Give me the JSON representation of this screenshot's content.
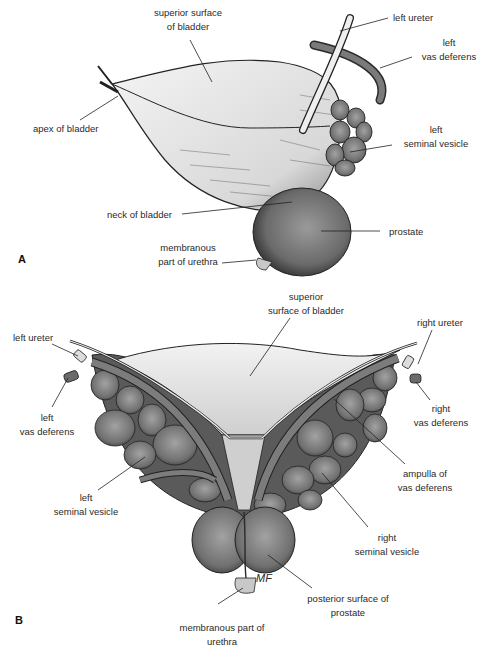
{
  "figure_a": {
    "panel_label": "A",
    "labels": {
      "superior_surface_1": "superior surface",
      "superior_surface_2": "of bladder",
      "left_ureter": "left ureter",
      "left_vas_1": "left",
      "left_vas_2": "vas deferens",
      "apex": "apex of bladder",
      "left_sv_1": "left",
      "left_sv_2": "seminal vesicle",
      "neck": "neck of bladder",
      "prostate": "prostate",
      "membranous_1": "membranous",
      "membranous_2": "part of urethra"
    }
  },
  "figure_b": {
    "panel_label": "B",
    "labels": {
      "superior_1": "superior",
      "superior_2": "surface of bladder",
      "left_ureter": "left ureter",
      "right_ureter": "right ureter",
      "left_vas_1": "left",
      "left_vas_2": "vas deferens",
      "right_vas_1": "right",
      "right_vas_2": "vas deferens",
      "ampulla_1": "ampulla of",
      "ampulla_2": "vas deferens",
      "left_sv_1": "left",
      "left_sv_2": "seminal vesicle",
      "right_sv_1": "right",
      "right_sv_2": "seminal vesicle",
      "posterior_1": "posterior surface of",
      "posterior_2": "prostate",
      "membranous_1": "membranous part of",
      "membranous_2": "urethra",
      "signature": "MF"
    }
  },
  "colors": {
    "organ_dark": "#5e5e5e",
    "organ_mid": "#8a8a8a",
    "bladder_light": "#e6e6e6",
    "line": "#222222"
  }
}
